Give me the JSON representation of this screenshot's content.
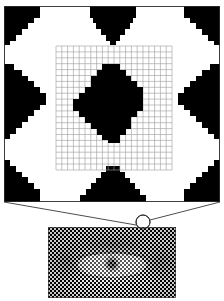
{
  "figure": {
    "caption": "",
    "background_color": "#ffffff",
    "ink_color": "#000000",
    "grid_color": "#8c8c8c",
    "outline_color": "#1a1a1a"
  },
  "magnified_panel": {
    "name": "magnified-halftone-patch",
    "x": 4,
    "y": 6,
    "width": 216,
    "height": 196,
    "description": "Enlarged black-and-white halftone dot pattern showing stepped diamond clusters",
    "border_color": "#2b2b2b",
    "fill_color": "#ffffff",
    "dot_color": "#000000",
    "cell_size_px": 5.8,
    "clusters": [
      {
        "name": "center-diamond",
        "cx": 114,
        "cy": 104,
        "radius_cells": 6
      },
      {
        "name": "left-edge-diamond",
        "cx": 4,
        "cy": 104,
        "radius_cells": 10
      },
      {
        "name": "right-edge-diamond",
        "cx": 224,
        "cy": 104,
        "radius_cells": 10
      },
      {
        "name": "top-edge-diamond",
        "cx": 114,
        "cy": 4,
        "radius_cells": 9
      },
      {
        "name": "bottom-edge-diamond",
        "cx": 114,
        "cy": 204,
        "radius_cells": 9
      },
      {
        "name": "corner-diamond-top-left",
        "cx": 4,
        "cy": 6,
        "radius_cells": 5
      },
      {
        "name": "corner-diamond-top-right",
        "cx": 222,
        "cy": 6,
        "radius_cells": 5
      },
      {
        "name": "corner-diamond-bottom-left",
        "cx": 4,
        "cy": 202,
        "radius_cells": 5
      },
      {
        "name": "corner-diamond-bottom-right",
        "cx": 222,
        "cy": 202,
        "radius_cells": 5
      }
    ]
  },
  "measurement_grid": {
    "name": "sampling-grid-overlay",
    "x": 56,
    "y": 46,
    "width": 116,
    "height": 124,
    "columns": 20,
    "rows": 21,
    "line_color": "#9a9a9a",
    "line_width": 0.6
  },
  "source_image": {
    "name": "halftone-eye-photo",
    "x": 48,
    "y": 227,
    "width": 128,
    "height": 71,
    "description": "Halftone screened photograph of a human eye",
    "border_color": "#333333",
    "dot_pitch_px": 2.1
  },
  "callout": {
    "name": "magnifier-callout",
    "circle": {
      "cx": 143,
      "cy": 222,
      "r": 7
    },
    "line_left": {
      "x1": 4,
      "y1": 202,
      "x2": 136,
      "y2": 224
    },
    "line_right": {
      "x1": 220,
      "y1": 202,
      "x2": 150,
      "y2": 221
    },
    "stroke_color": "#1f1f1f",
    "stroke_width": 0.8
  },
  "labels": {
    "panel_label": "",
    "source_label": "",
    "callout_label": ""
  }
}
